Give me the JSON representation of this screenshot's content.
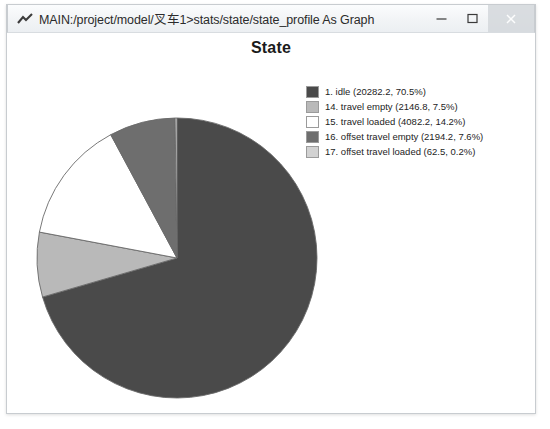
{
  "window": {
    "title": "MAIN:/project/model/叉车1>stats/state/state_profile As Graph",
    "icon": "chart-app-icon",
    "buttons": {
      "minimize": "minimize-icon",
      "maximize": "maximize-icon",
      "close": "close-icon"
    }
  },
  "chart_data": {
    "type": "pie",
    "title": "State",
    "xlabel": "",
    "ylabel": "",
    "legend_position": "right",
    "grid": false,
    "start_angle_deg": 0,
    "direction": "clockwise",
    "categories": [
      "1. idle",
      "14. travel empty",
      "15. travel loaded",
      "16. offset travel empty",
      "17. offset travel loaded"
    ],
    "values": [
      20282.2,
      2146.8,
      4082.2,
      2194.2,
      62.5
    ],
    "percents": [
      70.5,
      7.5,
      14.2,
      7.6,
      0.2
    ],
    "colors": [
      "#4a4a4a",
      "#b9b9b9",
      "#ffffff",
      "#6e6e6e",
      "#d2d2d2"
    ],
    "legend_labels": [
      "1. idle (20282.2, 70.5%)",
      "14. travel empty (2146.8, 7.5%)",
      "15. travel loaded (4082.2, 14.2%)",
      "16. offset travel empty (2194.2, 7.6%)",
      "17. offset travel loaded (62.5, 0.2%)"
    ],
    "swatch_colors": [
      "#4a4a4a",
      "#b9b9b9",
      "#ffffff",
      "#6e6e6e",
      "#d2d2d2"
    ]
  }
}
